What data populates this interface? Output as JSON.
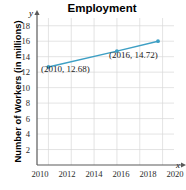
{
  "chart_data": {
    "type": "line",
    "title": "Employment",
    "xlabel": "x",
    "ylabel": "Number of Workers (in millions)",
    "axis_letter_x": "x",
    "axis_letter_y": "y",
    "x": [
      2010,
      2016,
      2019.6
    ],
    "values": [
      12.68,
      14.72,
      16.0
    ],
    "series": [
      {
        "name": "Employment",
        "x": [
          2010,
          2016,
          2019.6
        ],
        "values": [
          12.68,
          14.72,
          16.0
        ]
      }
    ],
    "xlim": [
      2009,
      2021
    ],
    "ylim": [
      0,
      19
    ],
    "xticks": [
      2010,
      2012,
      2014,
      2016,
      2018,
      2020
    ],
    "xticklabels": [
      "2010",
      "2012",
      "2014",
      "2016",
      "2018",
      "2020"
    ],
    "yticks": [
      2,
      4,
      6,
      8,
      10,
      12,
      14,
      16,
      18
    ],
    "yticklabels": [
      "18",
      "16",
      "14",
      "12",
      "10",
      "8",
      "6",
      "4",
      "2"
    ],
    "grid": true,
    "legend": false,
    "line_color": "#3d9fc4",
    "marker_color": "#3d9fc4",
    "grid_color": "#d9d9d9",
    "axis_color": "#5a5a5a",
    "annotations": [
      {
        "label": "(2010, 12.68)",
        "x": 2010,
        "y": 12.68
      },
      {
        "label": "(2016, 14.72)",
        "x": 2016,
        "y": 14.72
      }
    ]
  }
}
